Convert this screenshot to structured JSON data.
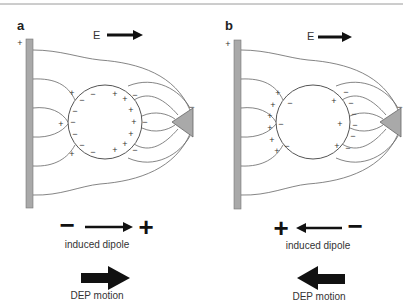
{
  "figure": {
    "panels": [
      {
        "id": "a",
        "label": "a",
        "field_label": "E",
        "electrode_charge": "+",
        "tip_charge": "−",
        "dipole": {
          "left": "−",
          "right": "+",
          "direction": "right"
        },
        "dipole_caption": "induced dipole",
        "motion_caption": "DEP motion",
        "motion_direction": "right",
        "sphere_charges_note": "positive DEP: particle more polarizable than medium"
      },
      {
        "id": "b",
        "label": "b",
        "field_label": "E",
        "electrode_charge": "+",
        "tip_charge": "−",
        "dipole": {
          "left": "+",
          "right": "−",
          "direction": "left"
        },
        "dipole_caption": "induced dipole",
        "motion_caption": "DEP motion",
        "motion_direction": "left"
      }
    ],
    "colors": {
      "electrode_fill": "#a9a9a9",
      "line": "#555555",
      "text": "#222222",
      "arrow": "#111111"
    }
  }
}
